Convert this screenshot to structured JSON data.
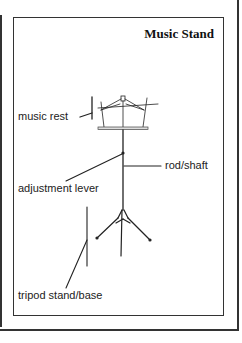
{
  "title": "Music Stand",
  "labels": {
    "music_rest": "music rest",
    "rod_shaft": "rod/shaft",
    "adjustment_lever": "adjustment lever",
    "tripod_base": "tripod stand/base"
  },
  "colors": {
    "line": "#222222",
    "frame": "#333333",
    "background": "#ffffff"
  }
}
